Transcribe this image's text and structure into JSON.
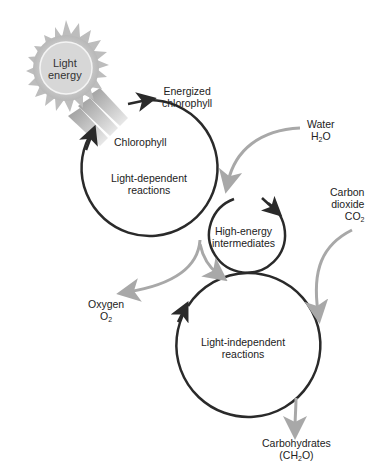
{
  "diagram": {
    "sun": {
      "line1": "Light",
      "line2": "energy"
    },
    "labels": {
      "energized_1": "Energized",
      "energized_2": "chlorophyll",
      "chlorophyll": "Chlorophyll",
      "water_1": "Water",
      "water_2": "H",
      "water_sub": "2",
      "water_3": "O",
      "light_dep_1": "Light-dependent",
      "light_dep_2": "reactions",
      "high_energy_1": "High-energy",
      "high_energy_2": "intermediates",
      "co2_1": "Carbon",
      "co2_2": "dioxide",
      "co2_3": "CO",
      "co2_sub": "2",
      "oxygen_1": "Oxygen",
      "oxygen_2": "O",
      "oxygen_sub": "2",
      "light_indep_1": "Light-independent",
      "light_indep_2": "reactions",
      "carbs_1": "Carbohydrates",
      "carbs_2": "(CH",
      "carbs_sub": "2",
      "carbs_3": "O)"
    },
    "colors": {
      "cycle": "#2a2a2a",
      "flow": "#a8a8a8",
      "sun": "#c8c8c8"
    }
  }
}
